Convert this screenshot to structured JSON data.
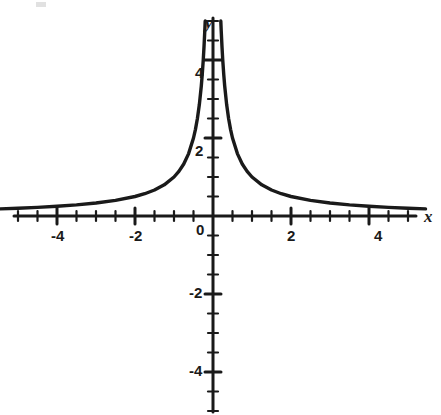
{
  "figure": {
    "background_color": "#ffffff",
    "ink_color": "#1a1a1a",
    "width": 441,
    "height": 415
  },
  "axes": {
    "x_axis_label": "x",
    "y_axis_label": "y",
    "origin_label": "0",
    "x_tick_labels": [
      "-4",
      "-2",
      "2",
      "4"
    ],
    "y_tick_labels": [
      "4",
      "2",
      "-2",
      "-4"
    ],
    "minor_tick_step": 0.5,
    "major_tick_step": 2
  },
  "chart_data": {
    "type": "line",
    "title": "",
    "subtitle": "",
    "xlabel": "x",
    "ylabel": "y",
    "xlim": [
      -5.45,
      5.8
    ],
    "ylim": [
      -5.05,
      5.05
    ],
    "grid": false,
    "legend": null,
    "x_ticks": [
      -5,
      -4.5,
      -4,
      -3.5,
      -3,
      -2.5,
      -2,
      -1.5,
      -1,
      -0.5,
      0,
      0.5,
      1,
      1.5,
      2,
      2.5,
      3,
      3.5,
      4,
      4.5,
      5
    ],
    "x_ticks_labeled": [
      -4,
      -2,
      0,
      2,
      4
    ],
    "y_ticks": [
      -5,
      -4.5,
      -4,
      -3.5,
      -3,
      -2.5,
      -2,
      -1.5,
      -1,
      -0.5,
      0.5,
      1,
      1.5,
      2,
      2.5,
      3,
      3.5,
      4,
      4.5,
      5
    ],
    "y_ticks_labeled": [
      4,
      2,
      -2,
      -4
    ],
    "annotations": [],
    "series": [
      {
        "name": "y = 1/|x|",
        "expression": "1/|x|",
        "asymptotes": {
          "vertical": [
            0
          ],
          "horizontal": [
            0
          ]
        },
        "branch_left": {
          "x": [
            -5.45,
            -5.0,
            -4.5,
            -4.0,
            -3.5,
            -3.0,
            -2.5,
            -2.0,
            -1.75,
            -1.5,
            -1.25,
            -1.0,
            -0.875,
            -0.75,
            -0.625,
            -0.5,
            -0.45,
            -0.4,
            -0.35,
            -0.3,
            -0.275,
            -0.25,
            -0.23,
            -0.21,
            -0.2
          ],
          "y": [
            0.183,
            0.2,
            0.222,
            0.25,
            0.286,
            0.333,
            0.4,
            0.5,
            0.571,
            0.667,
            0.8,
            1.0,
            1.143,
            1.333,
            1.6,
            2.0,
            2.222,
            2.5,
            2.857,
            3.333,
            3.636,
            4.0,
            4.348,
            4.762,
            5.0
          ]
        },
        "branch_right": {
          "x": [
            0.2,
            0.21,
            0.23,
            0.25,
            0.275,
            0.3,
            0.35,
            0.4,
            0.45,
            0.5,
            0.625,
            0.75,
            0.875,
            1.0,
            1.25,
            1.5,
            1.75,
            2.0,
            2.5,
            3.0,
            3.5,
            4.0,
            4.5,
            5.0,
            5.45
          ],
          "y": [
            5.0,
            4.762,
            4.348,
            4.0,
            3.636,
            3.333,
            2.857,
            2.5,
            2.222,
            2.0,
            1.6,
            1.333,
            1.143,
            1.0,
            0.8,
            0.667,
            0.571,
            0.5,
            0.4,
            0.333,
            0.286,
            0.25,
            0.222,
            0.2,
            0.183
          ]
        }
      }
    ]
  }
}
